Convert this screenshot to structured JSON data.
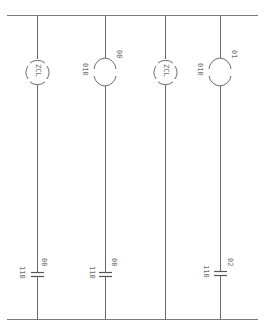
{
  "diagram": {
    "type": "ladder-logic",
    "orientation": "rotated-90",
    "colors": {
      "wire": "#6b6b6b",
      "rail": "#7a7a7a",
      "text": "#6a6a6a",
      "background": "#ffffff"
    },
    "rungs": [
      {
        "coil": {
          "kind": "special",
          "label": "ZCL",
          "prefix": ""
        },
        "contact": {
          "kind": "normally-open",
          "prefix": "110",
          "label": "00"
        }
      },
      {
        "coil": {
          "kind": "output",
          "label": "00",
          "prefix": "010"
        },
        "contact": {
          "kind": "normally-open",
          "prefix": "110",
          "label": "00"
        }
      },
      {
        "coil": {
          "kind": "special",
          "label": "ZCL",
          "prefix": ""
        },
        "contact": null
      },
      {
        "coil": {
          "kind": "output",
          "label": "01",
          "prefix": "010"
        },
        "contact": {
          "kind": "normally-open",
          "prefix": "110",
          "label": "02"
        }
      }
    ]
  },
  "labels": {
    "r0_coil": "ZCL",
    "r1_coil_prefix": "010",
    "r1_coil": "00",
    "r2_coil": "ZCL",
    "r3_coil_prefix": "010",
    "r3_coil": "01",
    "r0_contact_prefix": "110",
    "r0_contact": "00",
    "r1_contact_prefix": "110",
    "r1_contact": "00",
    "r3_contact_prefix": "110",
    "r3_contact": "02"
  }
}
